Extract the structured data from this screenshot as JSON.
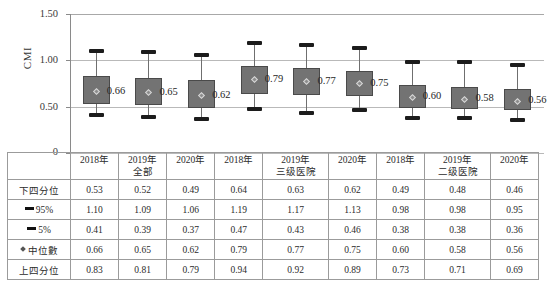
{
  "chart_data": {
    "type": "box",
    "title": "",
    "ylabel": "CMI",
    "xlabel": "",
    "ylim": [
      0,
      1.5
    ],
    "yticks": [
      "0",
      "0.50",
      "1.00",
      "1.50"
    ],
    "grid": true,
    "legend": "none",
    "groups": [
      {
        "name": "全部",
        "years": [
          "2018年",
          "2019年",
          "2020年"
        ]
      },
      {
        "name": "三级医院",
        "years": [
          "2018年",
          "2019年",
          "2020年"
        ]
      },
      {
        "name": "二级医院",
        "years": [
          "2018年",
          "2019年",
          "2020年"
        ]
      }
    ],
    "categories": [
      "全部 2018年",
      "全部 2019年",
      "全部 2020年",
      "三级医院 2018年",
      "三级医院 2019年",
      "三级医院 2020年",
      "二级医院 2018年",
      "二级医院 2019年",
      "二级医院 2020年"
    ],
    "series": [
      {
        "name": "下四分位",
        "values": [
          0.53,
          0.52,
          0.49,
          0.64,
          0.63,
          0.62,
          0.49,
          0.48,
          0.46
        ]
      },
      {
        "name": "95%",
        "values": [
          1.1,
          1.09,
          1.06,
          1.19,
          1.17,
          1.13,
          0.98,
          0.98,
          0.95
        ]
      },
      {
        "name": "5%",
        "values": [
          0.41,
          0.39,
          0.37,
          0.47,
          0.43,
          0.46,
          0.38,
          0.38,
          0.36
        ]
      },
      {
        "name": "中位數",
        "values": [
          0.66,
          0.65,
          0.62,
          0.79,
          0.77,
          0.75,
          0.6,
          0.58,
          0.56
        ]
      },
      {
        "name": "上四分位",
        "values": [
          0.83,
          0.81,
          0.79,
          0.94,
          0.92,
          0.89,
          0.73,
          0.71,
          0.69
        ]
      }
    ],
    "median_labels": [
      "0.66",
      "0.65",
      "0.62",
      "0.79",
      "0.77",
      "0.75",
      "0.60",
      "0.58",
      "0.56"
    ],
    "colors": {
      "box_fill": "#737373",
      "box_border": "#4a4a4a",
      "whisker": "#6f6f6f",
      "cap": "#1c1c1c",
      "grid": "#b9b9b9"
    }
  },
  "axis": {
    "y_title": "CMI",
    "ticks": [
      {
        "label": "1.50"
      },
      {
        "label": "1.00"
      },
      {
        "label": "0.50"
      },
      {
        "label": "0"
      }
    ]
  },
  "table": {
    "header": {
      "corner": "",
      "columns": [
        {
          "year": "2018年",
          "group": ""
        },
        {
          "year": "2019年",
          "group": "全部"
        },
        {
          "year": "2020年",
          "group": ""
        },
        {
          "year": "2018年",
          "group": ""
        },
        {
          "year": "2019年",
          "group": "三级医院"
        },
        {
          "year": "2020年",
          "group": ""
        },
        {
          "year": "2018年",
          "group": ""
        },
        {
          "year": "2019年",
          "group": "二级医院"
        },
        {
          "year": "2020年",
          "group": ""
        }
      ]
    },
    "rows": [
      {
        "marker": "none",
        "label": "下四分位",
        "cells": [
          "0.53",
          "0.52",
          "0.49",
          "0.64",
          "0.63",
          "0.62",
          "0.49",
          "0.48",
          "0.46"
        ]
      },
      {
        "marker": "dash",
        "label": "95%",
        "cells": [
          "1.10",
          "1.09",
          "1.06",
          "1.19",
          "1.17",
          "1.13",
          "0.98",
          "0.98",
          "0.95"
        ]
      },
      {
        "marker": "dash",
        "label": "5%",
        "cells": [
          "0.41",
          "0.39",
          "0.37",
          "0.47",
          "0.43",
          "0.46",
          "0.38",
          "0.38",
          "0.36"
        ]
      },
      {
        "marker": "diamond",
        "label": "中位數",
        "cells": [
          "0.66",
          "0.65",
          "0.62",
          "0.79",
          "0.77",
          "0.75",
          "0.60",
          "0.58",
          "0.56"
        ]
      },
      {
        "marker": "none",
        "label": "上四分位",
        "cells": [
          "0.83",
          "0.81",
          "0.79",
          "0.94",
          "0.92",
          "0.89",
          "0.73",
          "0.71",
          "0.69"
        ]
      }
    ]
  },
  "caption": {
    "text": ""
  }
}
